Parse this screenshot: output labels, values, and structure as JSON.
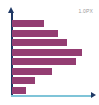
{
  "widget": {
    "name": "horizontal-bar-chart-thumbnail",
    "width_px": 99,
    "height_px": 105,
    "background_color": "#ffffff"
  },
  "legend": {
    "label": "1.0PX",
    "color": "#9a9a9a"
  },
  "axes": {
    "y_axis_color": "#1f3864",
    "x_axis_color": "#7fc4d8",
    "arrow_color": "#1f3864"
  },
  "chart_data": {
    "type": "bar",
    "orientation": "horizontal",
    "title": "",
    "subtitle": "",
    "xlabel": "",
    "ylabel": "",
    "grid": false,
    "legend_position": "top-right",
    "legend_entries": [
      "1.0PX"
    ],
    "series_color": "#943d72",
    "categories": [
      "1",
      "2",
      "3",
      "4",
      "5",
      "6",
      "7",
      "8"
    ],
    "values": [
      30,
      43,
      52,
      66,
      60,
      38,
      22,
      13
    ],
    "xlim": [
      0,
      82
    ],
    "ylim": [
      0,
      8
    ],
    "tick_labels_x": [],
    "tick_labels_y": [],
    "annotations": [],
    "series": [
      {
        "name": "1.0PX",
        "color": "#943d72",
        "values": [
          30,
          43,
          52,
          66,
          60,
          38,
          22,
          13
        ]
      }
    ]
  }
}
